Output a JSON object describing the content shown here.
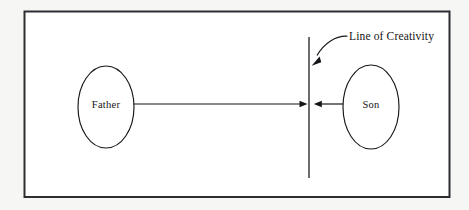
{
  "diagram": {
    "title": "Line of Creativity",
    "background_color": "#f6f6f4",
    "canvas_color": "#ffffff",
    "ink_color": "#15161a",
    "frame_color": "#2b2d31",
    "nodes": [
      {
        "id": "father",
        "label": "Father",
        "shape": "ellipse",
        "cx": 106,
        "cy": 107,
        "rx": 28,
        "ry": 41
      },
      {
        "id": "son",
        "label": "Son",
        "shape": "ellipse",
        "cx": 371,
        "cy": 107,
        "rx": 28,
        "ry": 42
      }
    ],
    "divider": {
      "name": "line-of-creativity",
      "label": "Line of Creativity",
      "orientation": "vertical",
      "x": 309,
      "y_top": 37,
      "y_bottom": 178
    },
    "connectors": [
      {
        "id": "father-to-line",
        "from": "father",
        "to": "line-of-creativity",
        "direction": "right",
        "x_start": 134,
        "x_end": 306,
        "y": 104
      },
      {
        "id": "son-to-line",
        "from": "son",
        "to": "line-of-creativity",
        "direction": "left",
        "x_start": 343,
        "x_end": 314,
        "y": 104
      }
    ],
    "annotation": {
      "text": "Line of Creativity",
      "text_x": 349,
      "text_y": 37,
      "pointer_from_x": 347,
      "pointer_from_y": 36,
      "pointer_to_x": 312,
      "pointer_to_y": 65
    }
  }
}
